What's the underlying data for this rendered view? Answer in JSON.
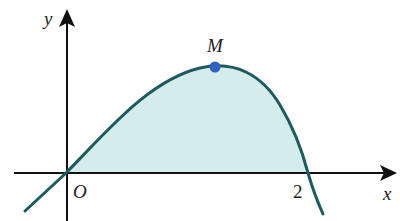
{
  "diagram": {
    "type": "function-graph",
    "axes": {
      "x_label": "x",
      "y_label": "y",
      "origin_label": "O",
      "x_ticks": [
        {
          "value": 2,
          "label": "2"
        }
      ]
    },
    "curve": {
      "description": "cubic-like curve through origin, rising to maximum at M, crossing x-axis at x=2",
      "stroke_color": "#1f5a5e",
      "fill_region": "area between curve and x-axis from 0 to 2",
      "fill_color": "#d4ecec"
    },
    "points": [
      {
        "label": "M",
        "role": "maximum point",
        "color": "#2f5fc4"
      }
    ],
    "colors": {
      "axis": "#111111",
      "curve": "#1f5a5e",
      "shade": "#d4ecec",
      "point": "#2f5fc4"
    }
  }
}
